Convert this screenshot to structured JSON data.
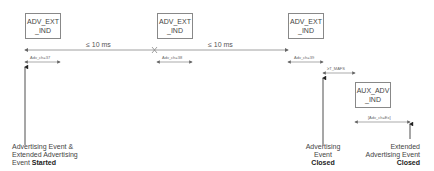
{
  "boxes": {
    "adv_ext_ind_1": {
      "line1": "ADV_EXT",
      "line2": "_IND"
    },
    "adv_ext_ind_2": {
      "line1": "ADV_EXT",
      "line2": "_IND"
    },
    "adv_ext_ind_3": {
      "line1": "ADV_EXT",
      "line2": "_IND"
    },
    "aux_adv_ind": {
      "line1": "AUX_ADV",
      "line2": "_IND"
    }
  },
  "intervals": {
    "gap_1": "≤ 10 ms",
    "gap_2": "≤ 10 ms",
    "ch37": "Adv_ch=37",
    "ch38": "Adv_ch=38",
    "ch39": "Adv_ch=39",
    "mafs": "≥T_MAFS",
    "aux_ch": "[Adv_ch=Ex]"
  },
  "captions": {
    "started": {
      "line1": "Advertising Event &",
      "line2": "Extended Advertising",
      "line3_prefix": "Event ",
      "line3_bold": "Started"
    },
    "adv_closed": {
      "line1": "Advertising",
      "line2": "Event",
      "line3_bold": "Closed"
    },
    "ext_closed": {
      "line1": "Extended",
      "line2": "Advertising Event",
      "line3_bold": "Closed"
    }
  }
}
